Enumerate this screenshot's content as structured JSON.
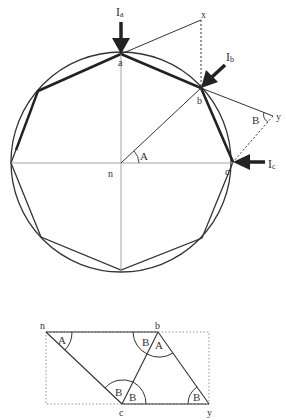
{
  "top_diagram": {
    "labels": {
      "a": "a",
      "b": "b",
      "c": "c",
      "n": "n",
      "x": "x",
      "y": "y",
      "angle_A": "A",
      "angle_B": "B",
      "force_a_main": "I",
      "force_a_sub": "a",
      "force_b_main": "I",
      "force_b_sub": "b",
      "force_c_main": "I",
      "force_c_sub": "c"
    }
  },
  "bottom_diagram": {
    "labels": {
      "n": "n",
      "b": "b",
      "c": "c",
      "y": "y",
      "angle_n": "A",
      "angle_b_left": "B",
      "angle_b_right": "A",
      "angle_c_left": "B",
      "angle_c_right": "B",
      "angle_y": "B"
    }
  },
  "colors": {
    "stroke": "#333333",
    "thin_stroke": "#888888",
    "background": "#ffffff"
  }
}
